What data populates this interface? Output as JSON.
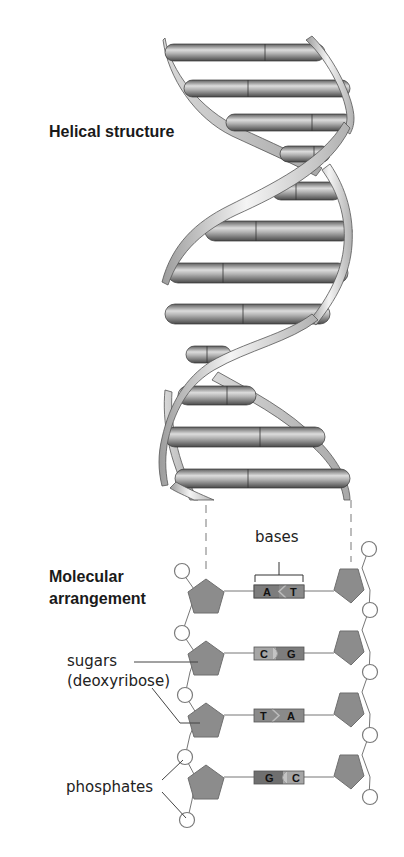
{
  "diagram": {
    "title_helical": "Helical structure",
    "title_molecular_line1": "Molecular",
    "title_molecular_line2": "arrangement",
    "labels": {
      "bases": "bases",
      "sugars": "sugars",
      "deoxyribose": "(deoxyribose)",
      "phosphates": "phosphates"
    },
    "base_pairs": [
      {
        "left": "A",
        "right": "T",
        "connector": "wedge-left"
      },
      {
        "left": "C",
        "right": "G",
        "connector": "arc-right"
      },
      {
        "left": "T",
        "right": "A",
        "connector": "wedge-right"
      },
      {
        "left": "G",
        "right": "C",
        "connector": "arc-left"
      }
    ],
    "colors": {
      "pentagon_fill": "#8c8c8c",
      "pentagon_stroke": "#6f6f6f",
      "phosphate_fill": "#ffffff",
      "phosphate_stroke": "#7a7a7a",
      "base_dark": "#7d7d7d",
      "base_light": "#a6a6a6",
      "rung_dark": "#5a5a5a",
      "rung_light": "#d6d6d6",
      "ribbon_light": "#eeeeee",
      "ribbon_dark": "#9a9a9a",
      "text": "#1a1a1a"
    }
  }
}
